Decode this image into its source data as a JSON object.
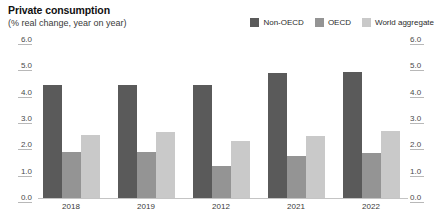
{
  "chart_data": {
    "type": "bar",
    "title": "Private consumption",
    "subtitle": "(% real change, year on year)",
    "xlabel": "",
    "ylabel": "",
    "ylim": [
      0.0,
      6.0
    ],
    "ytick_labels": [
      "6.0",
      "5.0",
      "4.0",
      "3.0",
      "2.0",
      "1.0",
      "0.0"
    ],
    "ytick_values": [
      6.0,
      5.0,
      4.0,
      3.0,
      2.0,
      1.0,
      0.0
    ],
    "grid": false,
    "dual_axis": true,
    "legend_position": "top-right",
    "categories": [
      "2018",
      "2019",
      "2012",
      "2021",
      "2022"
    ],
    "series": [
      {
        "name": "Non-OECD",
        "color": "#5a5a5a",
        "values": [
          4.3,
          4.3,
          4.3,
          4.75,
          4.8
        ]
      },
      {
        "name": "OECD",
        "color": "#949494",
        "values": [
          1.75,
          1.75,
          1.2,
          1.6,
          1.7
        ]
      },
      {
        "name": "World aggregate",
        "color": "#c9c9c9",
        "values": [
          2.4,
          2.5,
          2.15,
          2.35,
          2.55
        ]
      }
    ],
    "footnote": ""
  }
}
